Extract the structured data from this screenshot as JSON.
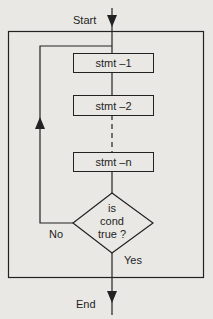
{
  "diagram": {
    "type": "flowchart",
    "start_label": "Start",
    "end_label": "End",
    "statements": [
      {
        "label": "stmt –1"
      },
      {
        "label": "stmt –2"
      },
      {
        "label": "stmt –n"
      }
    ],
    "decision": {
      "line1": "is",
      "line2": "cond",
      "line3": "true ?"
    },
    "branch_no_label": "No",
    "branch_yes_label": "Yes",
    "colors": {
      "background": "#e9e8e4",
      "line": "#222222",
      "text": "#1e1e1e"
    }
  }
}
